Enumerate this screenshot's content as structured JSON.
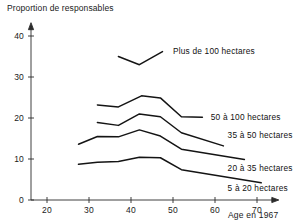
{
  "chart_data": {
    "type": "line",
    "title": "Proportion de responsables",
    "xlabel": "Age en 1967",
    "ylabel": "Proportion de responsables",
    "xlim": [
      16,
      74
    ],
    "ylim": [
      0,
      43
    ],
    "xticks": [
      20,
      30,
      40,
      50,
      60,
      70
    ],
    "yticks": [
      0,
      10,
      20,
      30,
      40
    ],
    "xticklabels": [
      "20",
      "30",
      "40",
      "50",
      "60",
      "70"
    ],
    "yticklabels": [
      "0",
      "10",
      "20",
      "30",
      "40"
    ],
    "grid": false,
    "legend_position": "inline-right-of-curve",
    "series": [
      {
        "name": "Plus de 100 hectares",
        "label": "Plus de 100 hectares",
        "label_x": 50,
        "label_y": 36.4,
        "x": [
          37,
          42,
          47.5
        ],
        "y": [
          35.0,
          33.0,
          36.2
        ]
      },
      {
        "name": "50 à 100 hectares",
        "label": "50 à 100 hectares",
        "label_x": 59,
        "label_y": 20.3,
        "x": [
          32,
          37,
          42.5,
          47,
          52,
          57
        ],
        "y": [
          23.2,
          22.7,
          25.4,
          24.9,
          20.3,
          20.2
        ]
      },
      {
        "name": "35 à 50 hectares",
        "label": "35 à 50 hectares",
        "label_x": 63,
        "label_y": 15.8,
        "x": [
          32,
          37,
          42,
          47,
          52,
          62
        ],
        "y": [
          18.9,
          18.2,
          21.0,
          20.3,
          16.4,
          13.2
        ]
      },
      {
        "name": "20 à 35 hectares",
        "label": "20 à 35 hectares",
        "label_x": 63,
        "label_y": 7.9,
        "x": [
          27.5,
          32,
          37,
          42,
          47,
          52,
          67
        ],
        "y": [
          13.6,
          15.5,
          15.4,
          17.1,
          15.6,
          12.4,
          9.9
        ]
      },
      {
        "name": "5 à 20 hectares",
        "label": "5 à 20 hectares",
        "label_x": 63,
        "label_y": 2.9,
        "x": [
          27.5,
          32,
          37,
          42,
          47,
          52,
          71
        ],
        "y": [
          8.7,
          9.2,
          9.4,
          10.4,
          10.3,
          7.4,
          4.2
        ]
      }
    ]
  },
  "colors": {
    "line": "#141414",
    "axis": "#2b2b2b",
    "text": "#1a1a1a",
    "background": "#ffffff"
  }
}
